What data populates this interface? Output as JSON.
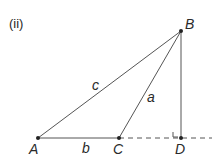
{
  "figure_label": "(ii)",
  "points": {
    "A": {
      "label": "A",
      "x": 38,
      "y": 138
    },
    "B": {
      "label": "B",
      "x": 181,
      "y": 31
    },
    "C": {
      "label": "C",
      "x": 119,
      "y": 138
    },
    "D": {
      "label": "D",
      "x": 181,
      "y": 138
    }
  },
  "sides": {
    "a": "a",
    "b": "b",
    "c": "c"
  },
  "colors": {
    "line": "#555555",
    "point": "#222222"
  }
}
